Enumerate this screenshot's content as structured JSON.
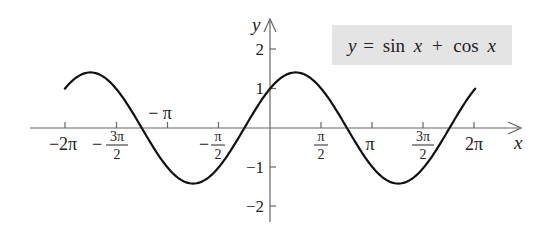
{
  "chart_data": {
    "type": "line",
    "title": "y = sin x + cos x",
    "xlabel": "x",
    "ylabel": "y",
    "xlim": [
      -6.2832,
      6.2832
    ],
    "ylim": [
      -2.3,
      2.3
    ],
    "grid": false,
    "legend": null,
    "x_ticks": [
      {
        "value": -6.2832,
        "label_num": "−2π",
        "label_den": ""
      },
      {
        "value": -4.7124,
        "label_num": "−3π",
        "label_den": "2"
      },
      {
        "value": -3.1416,
        "label_num": "−π",
        "label_den": ""
      },
      {
        "value": -1.5708,
        "label_num": "−π",
        "label_den": "2"
      },
      {
        "value": 1.5708,
        "label_num": "π",
        "label_den": "2"
      },
      {
        "value": 3.1416,
        "label_num": "π",
        "label_den": ""
      },
      {
        "value": 4.7124,
        "label_num": "3π",
        "label_den": "2"
      },
      {
        "value": 6.2832,
        "label_num": "2π",
        "label_den": ""
      }
    ],
    "y_ticks": [
      2,
      1,
      -1,
      -2
    ],
    "series": [
      {
        "name": "y = sin x + cos x",
        "function": "sin(x) + cos(x)",
        "x": [
          -6.2832,
          -5.4978,
          -4.7124,
          -3.927,
          -3.1416,
          -2.3562,
          -1.5708,
          -0.7854,
          0,
          0.7854,
          1.5708,
          2.3562,
          3.1416,
          3.927,
          4.7124,
          5.4978,
          6.2832
        ],
        "y": [
          1,
          1.414,
          1,
          0,
          -1,
          -1.414,
          -1,
          0,
          1,
          1.414,
          1,
          0,
          -1,
          -1.414,
          -1,
          0,
          1
        ]
      }
    ]
  },
  "labels": {
    "title": "y = sin x + cos x",
    "title_y": "y",
    "title_eq": "=",
    "title_sin": "sin",
    "title_x1": "x",
    "title_plus": "+",
    "title_cos": "cos",
    "title_x2": "x",
    "x_axis": "x",
    "y_axis": "y",
    "y2": "2",
    "y1": "1",
    "ym1": "−1",
    "ym2": "−2",
    "t_m2pi": "−2π",
    "t_m3pi2_minus": "−",
    "t_m3pi2_num": "3π",
    "t_m3pi2_den": "2",
    "t_mpi": "− π",
    "t_mpi2_minus": "−",
    "t_mpi2_num": "π",
    "t_mpi2_den": "2",
    "t_pi2_num": "π",
    "t_pi2_den": "2",
    "t_pi": "π",
    "t_3pi2_num": "3π",
    "t_3pi2_den": "2",
    "t_2pi": "2π"
  },
  "colors": {
    "curve": "#111111",
    "axis": "#666666",
    "title_box": "#e4e4e4"
  }
}
